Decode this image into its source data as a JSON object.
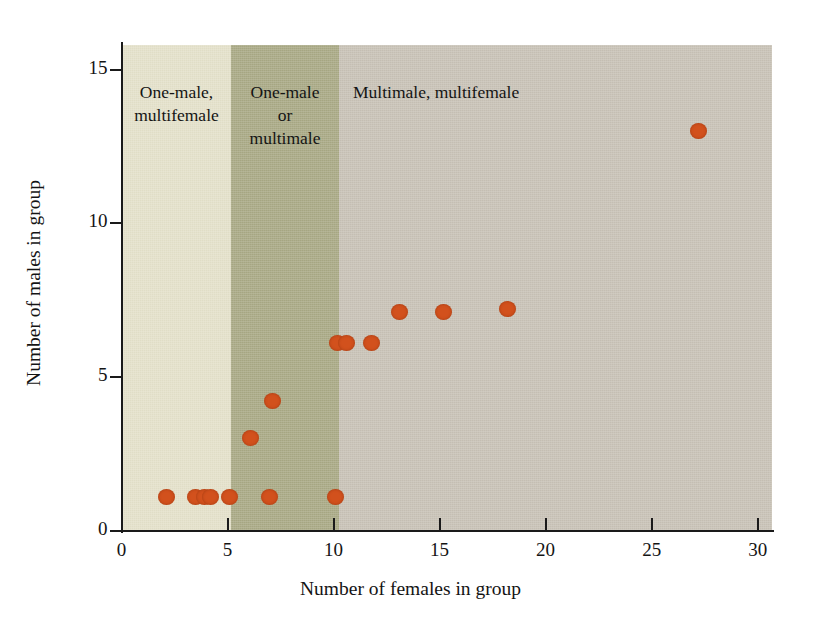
{
  "chart_data": {
    "type": "scatter",
    "title": "",
    "xlabel": "Number of females in group",
    "ylabel": "Number of males in group",
    "xlim": [
      0,
      30.7
    ],
    "ylim": [
      0,
      15.8
    ],
    "xticks": [
      "0",
      "5",
      "10",
      "15",
      "20",
      "25",
      "30"
    ],
    "xtick_values": [
      0,
      5,
      10,
      15,
      20,
      25,
      30
    ],
    "yticks": [
      "0",
      "5",
      "10",
      "15"
    ],
    "ytick_values": [
      0,
      5,
      10,
      15
    ],
    "grid": false,
    "legend": "none",
    "marker_color": "#d2511d",
    "points": [
      {
        "x": 2.1,
        "y": 1.1
      },
      {
        "x": 3.5,
        "y": 1.1
      },
      {
        "x": 3.9,
        "y": 1.1
      },
      {
        "x": 4.2,
        "y": 1.1
      },
      {
        "x": 5.1,
        "y": 1.1
      },
      {
        "x": 6.1,
        "y": 3.0
      },
      {
        "x": 7.0,
        "y": 1.1
      },
      {
        "x": 7.1,
        "y": 4.2
      },
      {
        "x": 10.1,
        "y": 1.1
      },
      {
        "x": 10.2,
        "y": 6.1
      },
      {
        "x": 10.6,
        "y": 6.1
      },
      {
        "x": 11.8,
        "y": 6.1
      },
      {
        "x": 13.1,
        "y": 7.1
      },
      {
        "x": 15.2,
        "y": 7.1
      },
      {
        "x": 18.2,
        "y": 7.2
      },
      {
        "x": 27.2,
        "y": 13.0
      }
    ],
    "regions": [
      {
        "name": "one-male-multifemale",
        "label": "One-male,\nmultifemale",
        "x_start": 0,
        "x_end": 5.5,
        "color": "#e4e1ca"
      },
      {
        "name": "one-male-or-multimale",
        "label": "One-male\nor\nmultimale",
        "x_start": 5.5,
        "x_end": 10.0,
        "color": "#a9a985"
      },
      {
        "name": "multimale-multifemale",
        "label": "Multimale, multifemale",
        "x_start": 10.0,
        "x_end": 30.7,
        "color": "#c8c2b6"
      }
    ]
  },
  "axes": {
    "x_title": "Number of females in group",
    "y_title": "Number of males in group",
    "x_tick_labels": [
      "0",
      "5",
      "10",
      "15",
      "20",
      "25",
      "30"
    ],
    "y_tick_labels": [
      "0",
      "5",
      "10",
      "15"
    ]
  },
  "regions": {
    "one_male_multifemale": "One-male,\nmultifemale",
    "one_male_or_multimale": "One-male\nor\nmultimale",
    "multimale_multifemale": "Multimale, multifemale"
  }
}
